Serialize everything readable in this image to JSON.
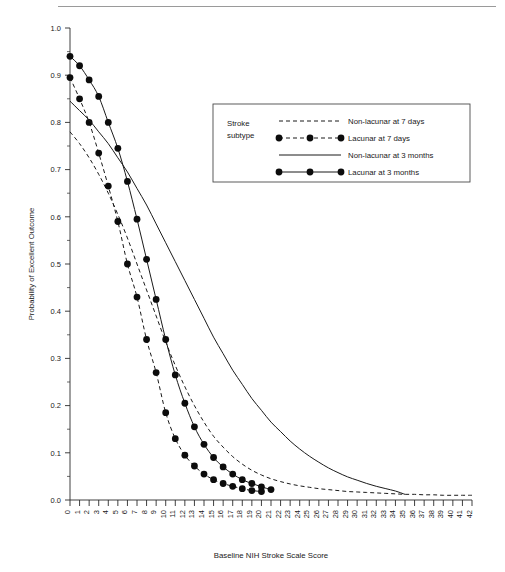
{
  "figure": {
    "top_rule": "horizontal-rule"
  },
  "chart_data": {
    "type": "line",
    "title": "",
    "xlabel": "Baseline NIH Stroke Scale Score",
    "ylabel": "Probability of Excellent Outcome",
    "xlim": [
      0,
      42
    ],
    "ylim": [
      0.0,
      1.0
    ],
    "grid": false,
    "xticks": [
      0,
      1,
      2,
      3,
      4,
      5,
      6,
      7,
      8,
      9,
      10,
      11,
      12,
      13,
      14,
      15,
      16,
      17,
      18,
      19,
      20,
      21,
      22,
      23,
      24,
      25,
      26,
      27,
      28,
      29,
      30,
      31,
      32,
      33,
      34,
      35,
      36,
      37,
      38,
      39,
      40,
      41,
      42
    ],
    "xtick_labels": [
      "0",
      "1",
      "2",
      "3",
      "4",
      "5",
      "6",
      "7",
      "8",
      "9",
      "10",
      "11",
      "12",
      "13",
      "14",
      "15",
      "16",
      "17",
      "18",
      "19",
      "20",
      "21",
      "22",
      "23",
      "24",
      "25",
      "26",
      "27",
      "28",
      "29",
      "30",
      "31",
      "32",
      "33",
      "34",
      "35",
      "36",
      "37",
      "38",
      "39",
      "40",
      "41",
      "42"
    ],
    "yticks": [
      0.0,
      0.1,
      0.2,
      0.3,
      0.4,
      0.5,
      0.6,
      0.7,
      0.8,
      0.9,
      1.0
    ],
    "ytick_labels": [
      "0.0",
      "0.1",
      "0.2",
      "0.3",
      "0.4",
      "0.5",
      "0.6",
      "0.7",
      "0.8",
      "0.9",
      "1.0"
    ],
    "y_minor_step": 0.05,
    "legend_position": "upper-center-right",
    "legend_title": "Stroke subtype",
    "series": [
      {
        "name": "Non-lacunar at 7 days",
        "style": "dashed",
        "markers": false,
        "x": [
          0,
          1,
          2,
          3,
          4,
          5,
          6,
          7,
          8,
          9,
          10,
          11,
          12,
          13,
          14,
          15,
          16,
          17,
          18,
          19,
          20,
          21,
          22,
          23,
          24,
          25,
          26,
          27,
          28,
          29,
          30,
          31,
          32,
          33,
          34,
          35,
          36,
          37,
          38,
          39,
          40,
          41,
          42
        ],
        "y": [
          0.78,
          0.755,
          0.725,
          0.69,
          0.65,
          0.605,
          0.555,
          0.5,
          0.445,
          0.39,
          0.335,
          0.285,
          0.24,
          0.2,
          0.165,
          0.135,
          0.112,
          0.092,
          0.076,
          0.063,
          0.053,
          0.045,
          0.039,
          0.034,
          0.03,
          0.027,
          0.024,
          0.022,
          0.02,
          0.018,
          0.017,
          0.016,
          0.015,
          0.014,
          0.013,
          0.012,
          0.012,
          0.011,
          0.011,
          0.01,
          0.01,
          0.01,
          0.01
        ]
      },
      {
        "name": "Lacunar at 7 days",
        "style": "dashed",
        "markers": true,
        "x": [
          0,
          1,
          2,
          3,
          4,
          5,
          6,
          7,
          8,
          9,
          10,
          11,
          12,
          13,
          14,
          15,
          16,
          17,
          18,
          19,
          20
        ],
        "y": [
          0.895,
          0.85,
          0.8,
          0.735,
          0.665,
          0.59,
          0.5,
          0.43,
          0.34,
          0.27,
          0.185,
          0.13,
          0.095,
          0.072,
          0.055,
          0.043,
          0.035,
          0.029,
          0.024,
          0.02,
          0.018
        ]
      },
      {
        "name": "Non-lacunar at 3 months",
        "style": "solid",
        "markers": false,
        "x": [
          0,
          1,
          2,
          3,
          4,
          5,
          6,
          7,
          8,
          9,
          10,
          11,
          12,
          13,
          14,
          15,
          16,
          17,
          18,
          19,
          20,
          21,
          22,
          23,
          24,
          25,
          26,
          27,
          28,
          29,
          30,
          31,
          32,
          33,
          34,
          35
        ],
        "y": [
          0.845,
          0.825,
          0.805,
          0.78,
          0.755,
          0.725,
          0.695,
          0.66,
          0.625,
          0.585,
          0.545,
          0.505,
          0.465,
          0.425,
          0.385,
          0.345,
          0.31,
          0.275,
          0.245,
          0.215,
          0.19,
          0.165,
          0.145,
          0.125,
          0.108,
          0.093,
          0.08,
          0.068,
          0.058,
          0.049,
          0.042,
          0.035,
          0.029,
          0.024,
          0.019,
          0.012
        ]
      },
      {
        "name": "Lacunar at 3 months",
        "style": "solid",
        "markers": true,
        "x": [
          0,
          1,
          2,
          3,
          4,
          5,
          6,
          7,
          8,
          9,
          10,
          11,
          12,
          13,
          14,
          15,
          16,
          17,
          18,
          19,
          20,
          21
        ],
        "y": [
          0.94,
          0.92,
          0.89,
          0.855,
          0.8,
          0.745,
          0.675,
          0.595,
          0.51,
          0.425,
          0.34,
          0.265,
          0.205,
          0.155,
          0.118,
          0.09,
          0.07,
          0.055,
          0.043,
          0.035,
          0.028,
          0.022
        ]
      }
    ]
  },
  "legend": {
    "title_line1": "Stroke",
    "title_line2": "subtype",
    "entries": [
      {
        "label": "Non-lacunar at 7 days",
        "style": "dashed",
        "markers": false
      },
      {
        "label": "Lacunar at 7 days",
        "style": "dashed",
        "markers": true
      },
      {
        "label": "Non-lacunar at 3 months",
        "style": "solid",
        "markers": false
      },
      {
        "label": "Lacunar at 3 months",
        "style": "solid",
        "markers": true
      }
    ]
  },
  "colors": {
    "ink": "#1a1a1a",
    "marker": "#0c0c0c",
    "axis": "#2b2b2b",
    "rule": "#9a9a9a",
    "legend_border": "#4a4a4a"
  }
}
